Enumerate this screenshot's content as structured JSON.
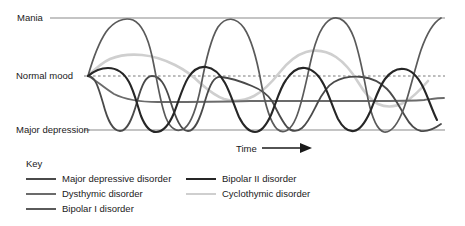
{
  "axis": {
    "y_labels": [
      {
        "id": "mania",
        "text": "Mania"
      },
      {
        "id": "normal",
        "text": "Normal mood"
      },
      {
        "id": "major_depression",
        "text": "Major depression"
      }
    ],
    "x_label": "Time",
    "x_arrow": "right-arrow"
  },
  "legend": {
    "title": "Key",
    "left_items": [
      {
        "label": "Major depressive disorder",
        "color": "#4a4a4a"
      },
      {
        "label": "Dysthymic disorder",
        "color": "#6b6b6b"
      },
      {
        "label": "Bipolar I disorder",
        "color": "#5a5a5a"
      }
    ],
    "right_items": [
      {
        "label": "Bipolar II disorder",
        "color": "#262626"
      },
      {
        "label": "Cyclothymic disorder",
        "color": "#cfcfcf"
      }
    ]
  },
  "colors": {
    "reference_line": "#8a8a8a",
    "dashed_line": "#7a7a7a",
    "major_depressive": "#4a4a4a",
    "dysthymic": "#6b6b6b",
    "bipolar_i": "#5a5a5a",
    "bipolar_ii": "#262626",
    "cyclothymic": "#cfcfcf",
    "background": "#ffffff",
    "text": "#1a1a1a"
  },
  "chart_data": {
    "type": "line",
    "title": "",
    "xlabel": "Time",
    "ylabel": "",
    "grid": false,
    "legend_position": "bottom",
    "x_range": [
      88,
      445
    ],
    "y_levels": {
      "mania": 18,
      "normal_mood": 76,
      "major_depression": 130
    },
    "y_axis_ticks": [
      "Mania",
      "Normal mood",
      "Major depression"
    ],
    "reference_lines": [
      {
        "name": "Mania",
        "y": 18,
        "style": "solid",
        "x_start": 88,
        "x_end": 445
      },
      {
        "name": "Normal mood",
        "y": 76,
        "style": "dashed",
        "x_start": 88,
        "x_end": 445
      },
      {
        "name": "Major depression",
        "y": 130,
        "style": "solid",
        "x_start": 88,
        "x_end": 445
      }
    ],
    "series": [
      {
        "name": "Major depressive disorder",
        "color": "#4a4a4a",
        "description": "Baseline at normal mood with recurring deep depressive episodes dropping to major depression",
        "path": "M 88,76 C 95,76 98,86 103,103 C 108,122 113,131 120,131 C 127,131 132,120 137,102 C 142,84 146,76 152,76 C 160,76 165,84 170,100 C 176,119 181,131 188,131 C 195,131 200,119 205,101 C 210,84 214,76 221,77 C 232,78 240,81 252,86 C 262,90 268,95 272,101 C 277,110 281,120 287,127 C 292,132 297,132 302,128 C 308,123 312,114 317,104 C 322,94 327,86 334,82 C 343,77 352,76 362,77 C 372,78 380,82 387,89 C 394,96 399,106 405,116 C 410,125 415,130 421,131 C 428,132 434,129 441,124"
      },
      {
        "name": "Dysthymic disorder",
        "color": "#6b6b6b",
        "description": "Chronic mildly depressed mood, nearly flat line slightly below normal mood",
        "path": "M 88,76 C 96,80 104,88 114,94 C 126,100 140,102 158,102 C 185,102 215,102 250,101 C 290,101 330,101 370,101 C 395,101 412,101 424,100 C 432,99 438,98 444,98"
      },
      {
        "name": "Bipolar I disorder",
        "color": "#5a5a5a",
        "description": "Full-range oscillation between mania and major depression",
        "path": "M 88,76 C 92,62 98,44 106,32 C 114,21 124,17 133,20 C 142,24 148,38 152,56 C 157,79 160,103 166,118 C 171,130 178,133 185,128 C 192,122 197,106 201,86 C 205,64 210,40 218,27 C 226,16 236,17 244,28 C 252,40 257,60 261,82 C 265,104 270,122 277,129 C 284,135 291,130 296,118 C 302,104 306,82 311,60 C 316,38 323,23 331,19 C 340,15 348,22 354,38 C 360,55 364,78 368,99 C 372,118 377,130 384,132 C 391,133 398,124 404,108 C 410,91 415,68 421,50 C 427,33 434,22 441,18"
      },
      {
        "name": "Bipolar II disorder",
        "color": "#262626",
        "description": "Hypomanic peaks above normal mood alternating with depressive troughs",
        "path": "M 88,76 C 94,71 100,68 108,68 C 117,68 124,73 129,82 C 134,91 137,104 141,116 C 145,126 150,132 156,132 C 163,132 169,125 174,113 C 179,100 183,86 188,78 C 193,70 199,66 206,67 C 214,68 220,74 225,83 C 230,92 234,105 239,117 C 244,127 249,132 255,132 C 261,132 266,126 271,115 C 276,103 280,88 286,80 C 292,71 298,67 305,68 C 313,69 319,75 324,85 C 329,95 333,108 338,119 C 343,128 348,132 354,131 C 360,130 365,123 370,112 C 375,100 379,87 385,79 C 391,71 397,68 404,69 C 412,70 418,77 423,87 C 428,97 432,110 437,120"
      },
      {
        "name": "Cyclothymic disorder",
        "color": "#cfcfcf",
        "description": "Mild mood swings of smaller amplitude hovering around normal mood",
        "path": "M 88,76 C 94,70 101,63 110,59 C 120,55 131,54 142,55 C 154,56 165,60 175,65 C 185,70 193,76 200,83 C 208,90 215,96 224,99 C 234,102 244,101 254,96 C 264,91 272,82 280,72 C 288,62 296,55 306,52 C 317,49 327,51 336,57 C 345,63 352,72 358,82 C 364,92 370,100 378,104 C 387,108 396,107 405,102 C 414,97 421,89 428,81"
      }
    ]
  }
}
